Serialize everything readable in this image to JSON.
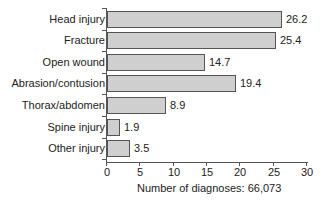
{
  "chart_data": {
    "type": "bar",
    "orientation": "horizontal",
    "title": "",
    "categories": [
      "Head injury",
      "Fracture",
      "Open wound",
      "Abrasion/contusion",
      "Thorax/abdomen",
      "Spine injury",
      "Other injury"
    ],
    "values": [
      26.2,
      25.4,
      14.7,
      19.4,
      8.9,
      1.9,
      3.5
    ],
    "value_labels": [
      "26.2",
      "25.4",
      "14.7",
      "19.4",
      "8.9",
      "1.9",
      "3.5"
    ],
    "xlabel": "Number of diagnoses: 66,073",
    "ylabel": "",
    "xlim": [
      0,
      30
    ],
    "x_ticks": [
      "0",
      "5",
      "10",
      "15",
      "20",
      "25",
      "30"
    ],
    "grid": false,
    "legend": null,
    "bar_color": "#cfcfcf",
    "bar_edge_color": "#555555"
  }
}
